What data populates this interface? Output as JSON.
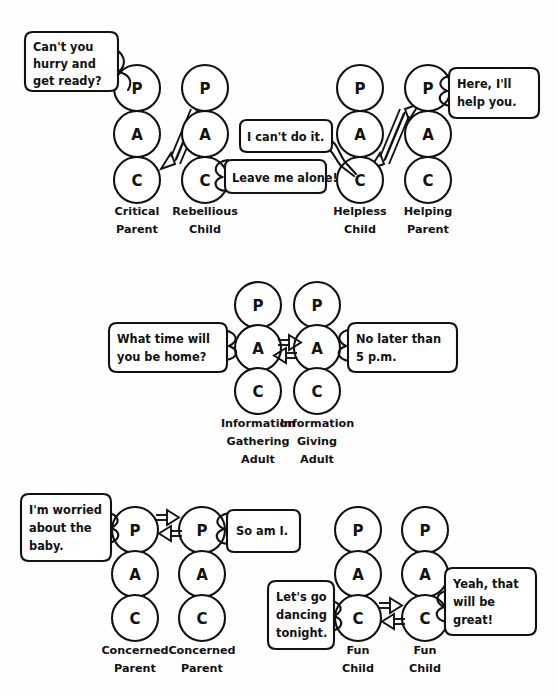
{
  "figure": {
    "type": "transactional-analysis-diagram",
    "ego_state_letters": {
      "parent": "P",
      "adult": "A",
      "child": "C"
    },
    "line_color": "#111111",
    "background_color": "#ffffff"
  },
  "rows": [
    {
      "id": "row-crossed-transaction",
      "groups": [
        {
          "id": "critical-parent-rebellious-child",
          "columns": [
            {
              "id": "critical-parent",
              "label_line1": "Critical",
              "label_line2": "Parent",
              "cx": 137,
              "states": [
                "P",
                "A",
                "C"
              ]
            },
            {
              "id": "rebellious-child",
              "label_line1": "Rebellious",
              "label_line2": "Child",
              "cx": 205,
              "states": [
                "P",
                "A",
                "C"
              ]
            }
          ],
          "bubbles": [
            {
              "id": "bubble-cant-you-hurry",
              "lines": [
                "Can't you",
                "hurry and",
                "get ready?"
              ],
              "align": "left"
            },
            {
              "id": "bubble-leave-me-alone",
              "lines": [
                "Leave me alone!"
              ],
              "align": "left"
            }
          ],
          "arrows": [
            {
              "id": "arrow-critical-p-to-rebellious-c",
              "from": "critical-parent.P",
              "to": "rebellious-child.C"
            },
            {
              "id": "arrow-rebellious-c-to-critical-p",
              "from": "rebellious-child.C",
              "to": "critical-parent.P"
            }
          ]
        },
        {
          "id": "helpless-child-helping-parent",
          "columns": [
            {
              "id": "helpless-child",
              "label_line1": "Helpless",
              "label_line2": "Child",
              "cx": 360,
              "states": [
                "P",
                "A",
                "C"
              ]
            },
            {
              "id": "helping-parent",
              "label_line1": "Helping",
              "label_line2": "Parent",
              "cx": 428,
              "states": [
                "P",
                "A",
                "C"
              ]
            }
          ],
          "bubbles": [
            {
              "id": "bubble-i-cant-do-it",
              "lines": [
                "I can't do it."
              ],
              "align": "left"
            },
            {
              "id": "bubble-here-ill-help-you",
              "lines": [
                "Here, I'll",
                "help you."
              ],
              "align": "left"
            }
          ],
          "arrows": [
            {
              "id": "arrow-helpless-c-to-helping-p",
              "from": "helpless-child.C",
              "to": "helping-parent.P"
            },
            {
              "id": "arrow-helping-p-to-helpless-c",
              "from": "helping-parent.P",
              "to": "helpless-child.C"
            }
          ]
        }
      ]
    },
    {
      "id": "row-complementary-adult-transaction",
      "groups": [
        {
          "id": "information-gathering-giving",
          "columns": [
            {
              "id": "information-gathering-adult",
              "label_line1": "Information",
              "label_line2": "Gathering",
              "label_line3": "Adult",
              "cx": 258,
              "states": [
                "P",
                "A",
                "C"
              ]
            },
            {
              "id": "information-giving-adult",
              "label_line1": "Information",
              "label_line2": "Giving",
              "label_line3": "Adult",
              "cx": 317,
              "states": [
                "P",
                "A",
                "C"
              ]
            }
          ],
          "bubbles": [
            {
              "id": "bubble-what-time-will-you-be-home",
              "lines": [
                "What time will",
                "you be home?"
              ],
              "align": "left"
            },
            {
              "id": "bubble-no-later-than-5pm",
              "lines": [
                "No later than",
                "5 p.m."
              ],
              "align": "left"
            }
          ],
          "arrows": [
            {
              "id": "arrow-gathering-a-to-giving-a",
              "from": "information-gathering-adult.A",
              "to": "information-giving-adult.A"
            },
            {
              "id": "arrow-giving-a-to-gathering-a",
              "from": "information-giving-adult.A",
              "to": "information-gathering-adult.A"
            }
          ]
        }
      ]
    },
    {
      "id": "row-parent-parent-and-child-child",
      "groups": [
        {
          "id": "concerned-parent-pair",
          "columns": [
            {
              "id": "concerned-parent-left",
              "label_line1": "Concerned",
              "label_line2": "Parent",
              "cx": 135,
              "states": [
                "P",
                "A",
                "C"
              ]
            },
            {
              "id": "concerned-parent-right",
              "label_line1": "Concerned",
              "label_line2": "Parent",
              "cx": 202,
              "states": [
                "P",
                "A",
                "C"
              ]
            }
          ],
          "bubbles": [
            {
              "id": "bubble-im-worried-about-the-baby",
              "lines": [
                "I'm worried",
                "about the",
                "baby."
              ],
              "align": "left"
            },
            {
              "id": "bubble-so-am-i",
              "lines": [
                "So am I."
              ],
              "align": "left"
            }
          ],
          "arrows": [
            {
              "id": "arrow-left-p-to-right-p",
              "from": "concerned-parent-left.P",
              "to": "concerned-parent-right.P"
            },
            {
              "id": "arrow-right-p-to-left-p",
              "from": "concerned-parent-right.P",
              "to": "concerned-parent-left.P"
            }
          ]
        },
        {
          "id": "fun-child-pair",
          "columns": [
            {
              "id": "fun-child-left",
              "label_line1": "Fun",
              "label_line2": "Child",
              "cx": 358,
              "states": [
                "P",
                "A",
                "C"
              ]
            },
            {
              "id": "fun-child-right",
              "label_line1": "Fun",
              "label_line2": "Child",
              "cx": 425,
              "states": [
                "P",
                "A",
                "C"
              ]
            }
          ],
          "bubbles": [
            {
              "id": "bubble-lets-go-dancing-tonight",
              "lines": [
                "Let's go",
                "dancing",
                "tonight."
              ],
              "align": "left"
            },
            {
              "id": "bubble-yeah-that-will-be-great",
              "lines": [
                "Yeah, that",
                "will be",
                "great!"
              ],
              "align": "left"
            }
          ],
          "arrows": [
            {
              "id": "arrow-left-c-to-right-c",
              "from": "fun-child-left.C",
              "to": "fun-child-right.C"
            },
            {
              "id": "arrow-right-c-to-left-c",
              "from": "fun-child-right.C",
              "to": "fun-child-left.C"
            }
          ]
        }
      ]
    }
  ]
}
